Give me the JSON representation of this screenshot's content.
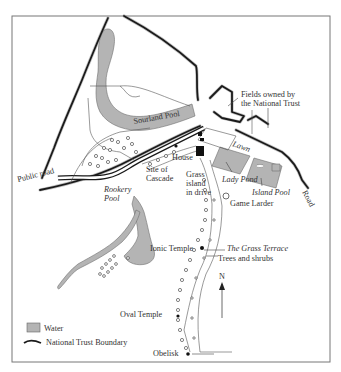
{
  "map": {
    "frame": {
      "x": 12,
      "y": 16,
      "width": 318,
      "height": 346
    },
    "colors": {
      "water": "#b4b4b4",
      "boundary": "#1a1a1a",
      "text": "#333333",
      "background": "#ffffff"
    },
    "labels": {
      "fields": [
        "Fields owned by",
        "the National Trust"
      ],
      "sourland_pool": "Sourland Pool",
      "lawn": "Lawn",
      "house": "House",
      "public_road": "Public road",
      "site_of_cascade": [
        "Site of",
        "Cascade"
      ],
      "grass_island": [
        "Grass",
        "island",
        "in drive"
      ],
      "lady_pond": "Lady Pond",
      "island_pool": "Island Pool",
      "road": "Road",
      "rookery_pool": [
        "Rookery",
        "Pool"
      ],
      "game_larder": "Game Larder",
      "ionic_temple": "Ionic Temple",
      "grass_terrace": "The Grass Terrace",
      "trees_and_shrubs": "Trees and shrubs",
      "north": "N",
      "oval_temple": "Oval Temple",
      "obelisk": "Obelisk"
    },
    "legend": {
      "items": [
        {
          "icon": "water-swatch-icon",
          "label": "Water"
        },
        {
          "icon": "boundary-line-icon",
          "label": "National Trust Boundary"
        }
      ]
    }
  }
}
